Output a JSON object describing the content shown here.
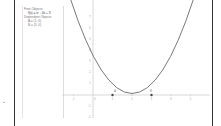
{
  "algebra_view": {
    "free_header": "Free Objects",
    "function": "f(x) = x² - 4x + 3",
    "dependent_header": "Dependent Objects",
    "point_a": "A = (1, 0)",
    "point_b": "B = (3, 0)"
  },
  "graphics_view": {
    "x_ticks": [
      "-1",
      "0",
      "1",
      "2",
      "3",
      "4",
      "5"
    ],
    "y_ticks": [
      "7",
      "6",
      "5",
      "4",
      "3",
      "2",
      "1",
      "-1",
      "-2"
    ],
    "point_labels": [
      "A",
      "B"
    ],
    "curve_color": "#555555",
    "axis_color": "#cccccc"
  }
}
